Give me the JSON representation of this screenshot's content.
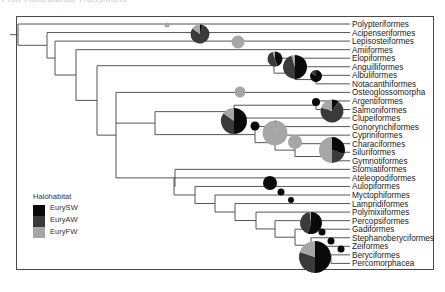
{
  "header": {
    "text": "Fish Halohabitat Transitions"
  },
  "colors": {
    "EurySW": "#0a0a0a",
    "EuryAW": "#3a3a3a",
    "EuryFW": "#a6a6a6",
    "branch": "#555555",
    "frame": "#4a4a4a"
  },
  "legend": {
    "title": "Halohabitat",
    "items": [
      {
        "label": "EurySW",
        "color": "#0a0a0a"
      },
      {
        "label": "EuryAW",
        "color": "#3a3a3a"
      },
      {
        "label": "EuryFW",
        "color": "#a6a6a6"
      }
    ]
  },
  "taxa": [
    "Polypteriformes",
    "Acipenseriformes",
    "Lepisosteiformes",
    "Amiiformes",
    "Elopiformes",
    "Anguilliformes",
    "Albuliformes",
    "Notacanthiformes",
    "Osteoglossomorpha",
    "Argentiformes",
    "Salmoniformes",
    "Clupeiformes",
    "Gonorynchiformes",
    "Cypriniformes",
    "Characiformes",
    "Siluriformes",
    "Gymnotiformes",
    "Stomiatiformes",
    "Ateleopodiformes",
    "Aulopiformes",
    "Myctophiformes",
    "Lampridiformes",
    "Polymixiiformes",
    "Percopsiformes",
    "Gadiformes",
    "Stephanoberyciformes",
    "Zeiformes",
    "Beryciformes",
    "Percomorphacea"
  ],
  "pies": [
    {
      "x": 167,
      "y": 25,
      "r": 2.5,
      "slices": {
        "EurySW": 0,
        "EuryAW": 0,
        "EuryFW": 1
      }
    },
    {
      "x": 200,
      "y": 34,
      "r": 9.5,
      "slices": {
        "EurySW": 0.05,
        "EuryAW": 0.8,
        "EuryFW": 0.15
      }
    },
    {
      "x": 238,
      "y": 42,
      "r": 6.5,
      "slices": {
        "EurySW": 0,
        "EuryAW": 0,
        "EuryFW": 1
      }
    },
    {
      "x": 275,
      "y": 59,
      "r": 7.5,
      "slices": {
        "EurySW": 0.45,
        "EuryAW": 0.5,
        "EuryFW": 0.05
      }
    },
    {
      "x": 295,
      "y": 67,
      "r": 12,
      "slices": {
        "EurySW": 0.5,
        "EuryAW": 0.45,
        "EuryFW": 0.05
      }
    },
    {
      "x": 316,
      "y": 76,
      "r": 6,
      "slices": {
        "EurySW": 0.85,
        "EuryAW": 0.15,
        "EuryFW": 0
      }
    },
    {
      "x": 240,
      "y": 92,
      "r": 5.5,
      "slices": {
        "EurySW": 0,
        "EuryAW": 0,
        "EuryFW": 1
      }
    },
    {
      "x": 316,
      "y": 102,
      "r": 4,
      "slices": {
        "EurySW": 1,
        "EuryAW": 0,
        "EuryFW": 0
      }
    },
    {
      "x": 332,
      "y": 111,
      "r": 11.5,
      "slices": {
        "EurySW": 0.1,
        "EuryAW": 0.7,
        "EuryFW": 0.2
      }
    },
    {
      "x": 234,
      "y": 121,
      "r": 13,
      "slices": {
        "EurySW": 0.5,
        "EuryAW": 0.35,
        "EuryFW": 0.15
      }
    },
    {
      "x": 255,
      "y": 126,
      "r": 4.5,
      "slices": {
        "EurySW": 1,
        "EuryAW": 0,
        "EuryFW": 0
      }
    },
    {
      "x": 275,
      "y": 133,
      "r": 12.5,
      "slices": {
        "EurySW": 0,
        "EuryAW": 0.01,
        "EuryFW": 0.99
      }
    },
    {
      "x": 295,
      "y": 142,
      "r": 7,
      "slices": {
        "EurySW": 0,
        "EuryAW": 0,
        "EuryFW": 1
      }
    },
    {
      "x": 332,
      "y": 150,
      "r": 13,
      "slices": {
        "EurySW": 0.3,
        "EuryAW": 0.2,
        "EuryFW": 0.5
      }
    },
    {
      "x": 270,
      "y": 183,
      "r": 7,
      "slices": {
        "EurySW": 1,
        "EuryAW": 0,
        "EuryFW": 0
      }
    },
    {
      "x": 281,
      "y": 192,
      "r": 3.5,
      "slices": {
        "EurySW": 1,
        "EuryAW": 0,
        "EuryFW": 0
      }
    },
    {
      "x": 291,
      "y": 200,
      "r": 3,
      "slices": {
        "EurySW": 1,
        "EuryAW": 0,
        "EuryFW": 0
      }
    },
    {
      "x": 311,
      "y": 223,
      "r": 11,
      "slices": {
        "EurySW": 0.55,
        "EuryAW": 0.43,
        "EuryFW": 0.02
      }
    },
    {
      "x": 322,
      "y": 232,
      "r": 3.5,
      "slices": {
        "EurySW": 1,
        "EuryAW": 0,
        "EuryFW": 0
      }
    },
    {
      "x": 331,
      "y": 241,
      "r": 3.5,
      "slices": {
        "EurySW": 1,
        "EuryAW": 0,
        "EuryFW": 0
      }
    },
    {
      "x": 341,
      "y": 249,
      "r": 3.5,
      "slices": {
        "EurySW": 1,
        "EuryAW": 0,
        "EuryFW": 0
      }
    },
    {
      "x": 315,
      "y": 257,
      "r": 16,
      "slices": {
        "EurySW": 0.5,
        "EuryAW": 0.3,
        "EuryFW": 0.2
      }
    }
  ]
}
